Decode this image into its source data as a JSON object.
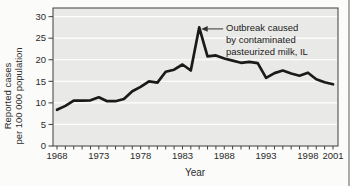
{
  "chart_data": {
    "type": "line",
    "title": "",
    "xlabel": "Year",
    "ylabel_lines": [
      "Reported cases",
      "per 100 000 population"
    ],
    "x": [
      1968,
      1969,
      1970,
      1971,
      1972,
      1973,
      1974,
      1975,
      1976,
      1977,
      1978,
      1979,
      1980,
      1981,
      1982,
      1983,
      1984,
      1985,
      1986,
      1987,
      1988,
      1989,
      1990,
      1991,
      1992,
      1993,
      1994,
      1995,
      1996,
      1997,
      1998,
      1999,
      2000,
      2001
    ],
    "values": [
      8.4,
      9.3,
      10.5,
      10.5,
      10.6,
      11.3,
      10.4,
      10.4,
      10.9,
      12.7,
      13.7,
      15.0,
      14.7,
      17.2,
      17.7,
      18.9,
      17.5,
      27.5,
      20.8,
      21.0,
      20.3,
      19.8,
      19.3,
      19.5,
      19.2,
      15.8,
      16.9,
      17.5,
      16.8,
      16.3,
      17.0,
      15.5,
      14.8,
      14.3
    ],
    "x_tick_labels": [
      1968,
      1973,
      1978,
      1983,
      1988,
      1993,
      1998,
      2001
    ],
    "y_ticks": [
      0,
      5,
      10,
      15,
      20,
      25,
      30
    ],
    "xlim": [
      1968,
      2001
    ],
    "ylim": [
      0,
      32
    ],
    "grid": "horizontal",
    "legend": "none",
    "annotation": {
      "lines": [
        "Outbreak caused",
        "by contaminated",
        "pasteurized milk, IL"
      ],
      "target_year": 1985,
      "target_value": 27.5
    }
  },
  "colors": {
    "plot_background": "#e9e9e7",
    "gridline": "#ffffff",
    "frame": "#3f3f3f",
    "series_line": "#1a1a1a",
    "text": "#2b2b2b",
    "page_background": "#fbfbf9"
  }
}
